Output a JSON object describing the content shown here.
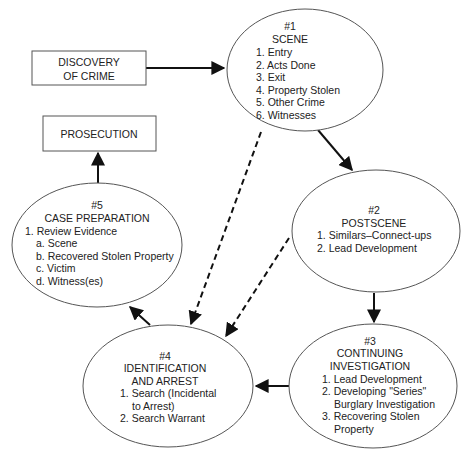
{
  "diagram": {
    "type": "flowchart",
    "nodes": {
      "discovery": {
        "shape": "rectangle",
        "lines": [
          "DISCOVERY",
          "OF CRIME"
        ]
      },
      "prosecution": {
        "shape": "rectangle",
        "lines": [
          "PROSECUTION"
        ]
      },
      "scene": {
        "shape": "ellipse",
        "number": "#1",
        "title": "SCENE",
        "items": [
          "1. Entry",
          "2. Acts Done",
          "3. Exit",
          "4. Property Stolen",
          "5. Other Crime",
          "6. Witnesses"
        ]
      },
      "postscene": {
        "shape": "ellipse",
        "number": "#2",
        "title": "POSTSCENE",
        "items": [
          "1. Similars–Connect-ups",
          "2. Lead Development"
        ]
      },
      "continuing": {
        "shape": "ellipse",
        "number": "#3",
        "title_lines": [
          "CONTINUING",
          "INVESTIGATION"
        ],
        "items": [
          "1. Lead Development",
          "2. Developing \"Series\"",
          "   Burglary Investigation",
          "3. Recovering Stolen",
          "   Property"
        ]
      },
      "identification": {
        "shape": "ellipse",
        "number": "#4",
        "title_lines": [
          "IDENTIFICATION",
          "AND ARREST"
        ],
        "items": [
          "1. Search (Incidental",
          "   to Arrest)",
          "2. Search Warrant"
        ]
      },
      "case_prep": {
        "shape": "ellipse",
        "number": "#5",
        "title": "CASE PREPARATION",
        "items": [
          "1. Review Evidence",
          "a. Scene",
          "b. Recovered Stolen Property",
          "c. Victim",
          "d. Witness(es)"
        ]
      }
    },
    "edges": [
      {
        "from": "discovery",
        "to": "scene",
        "style": "solid"
      },
      {
        "from": "scene",
        "to": "postscene",
        "style": "solid"
      },
      {
        "from": "postscene",
        "to": "continuing",
        "style": "solid"
      },
      {
        "from": "continuing",
        "to": "identification",
        "style": "solid"
      },
      {
        "from": "identification",
        "to": "case_prep",
        "style": "solid"
      },
      {
        "from": "case_prep",
        "to": "prosecution",
        "style": "solid"
      },
      {
        "from": "scene",
        "to": "identification",
        "style": "dashed"
      },
      {
        "from": "postscene",
        "to": "identification",
        "style": "dashed"
      }
    ]
  }
}
